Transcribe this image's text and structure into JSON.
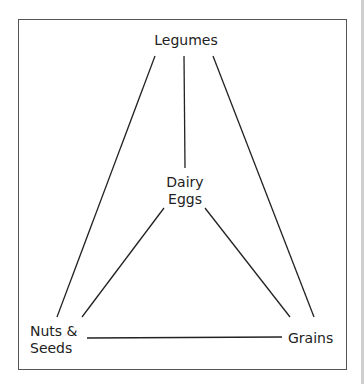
{
  "diagram": {
    "nodes": {
      "legumes": {
        "label": "Legumes"
      },
      "dairy": {
        "line1": "Dairy",
        "line2": "Eggs"
      },
      "nuts": {
        "line1": "Nuts &",
        "line2": "Seeds"
      },
      "grains": {
        "label": "Grains"
      }
    },
    "edges": [
      {
        "from": "Legumes",
        "to": "Nuts & Seeds"
      },
      {
        "from": "Legumes",
        "to": "Dairy Eggs"
      },
      {
        "from": "Legumes",
        "to": "Grains"
      },
      {
        "from": "Dairy Eggs",
        "to": "Nuts & Seeds"
      },
      {
        "from": "Dairy Eggs",
        "to": "Grains"
      },
      {
        "from": "Nuts & Seeds",
        "to": "Grains"
      }
    ]
  }
}
